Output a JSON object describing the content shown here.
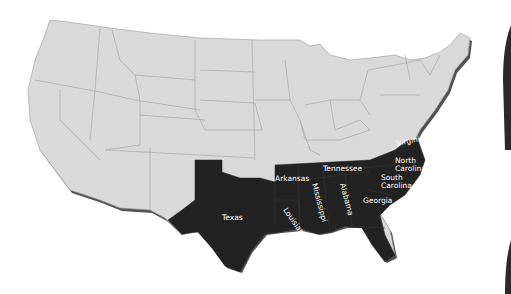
{
  "map": {
    "type": "choropleth",
    "region": "United States (contiguous)",
    "colors": {
      "highlighted": "#222222",
      "base": "#d9d9d9",
      "border": "#9a9a9a",
      "label": "#ffffff",
      "background": "#ffffff"
    },
    "highlighted_states": [
      {
        "name": "Texas"
      },
      {
        "name": "Arkansas"
      },
      {
        "name": "Louisiana"
      },
      {
        "name": "Mississippi"
      },
      {
        "name": "Tennessee"
      },
      {
        "name": "Alabama"
      },
      {
        "name": "Georgia"
      },
      {
        "name": "Florida"
      },
      {
        "name": "South Carolina"
      },
      {
        "name": "North Carolina"
      },
      {
        "name": "Virginia"
      }
    ],
    "labels": {
      "texas": "Texas",
      "arkansas": "Arkansas",
      "louisiana": "Louisiana",
      "mississippi": "Mississippi",
      "tennessee": "Tennessee",
      "alabama": "Alabama",
      "georgia": "Georgia",
      "florida": "Florida",
      "south_carolina_1": "South",
      "south_carolina_2": "Carolina",
      "north_carolina_1": "North",
      "north_carolina_2": "Carolina",
      "virginia": "Virginia"
    }
  }
}
